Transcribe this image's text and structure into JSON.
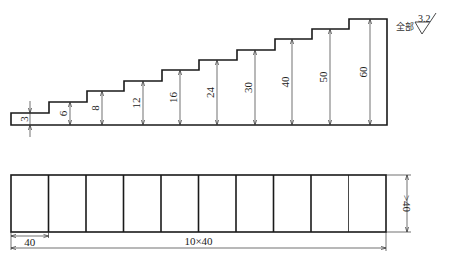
{
  "drawing": {
    "surface_finish": {
      "prefix": "全部",
      "value": "3.2",
      "symbol": "roughness-check-icon"
    },
    "staircase": {
      "steps": [
        {
          "label": "3",
          "x0": 11,
          "x1": 49,
          "top": 113,
          "dim_x": 30
        },
        {
          "label": "6",
          "x0": 49,
          "x1": 87,
          "top": 102,
          "dim_x": 70
        },
        {
          "label": "8",
          "x0": 87,
          "x1": 124,
          "top": 91,
          "dim_x": 102
        },
        {
          "label": "12",
          "x0": 124,
          "x1": 162,
          "top": 81,
          "dim_x": 143
        },
        {
          "label": "16",
          "x0": 162,
          "x1": 199,
          "top": 70,
          "dim_x": 180
        },
        {
          "label": "24",
          "x0": 199,
          "x1": 237,
          "top": 60,
          "dim_x": 217
        },
        {
          "label": "30",
          "x0": 237,
          "x1": 275,
          "top": 50,
          "dim_x": 255
        },
        {
          "label": "40",
          "x0": 275,
          "x1": 312,
          "top": 39,
          "dim_x": 292
        },
        {
          "label": "50",
          "x0": 312,
          "x1": 349,
          "top": 29,
          "dim_x": 330
        },
        {
          "label": "60",
          "x0": 349,
          "x1": 387,
          "top": 19,
          "dim_x": 370
        }
      ],
      "baseline_y": 125
    },
    "strip": {
      "cell_count": 10,
      "x0": 11,
      "x1": 386,
      "y0": 175,
      "y1": 232,
      "cell_width_label": "40",
      "total_length_label": "10×40",
      "height_label": ">40"
    }
  }
}
